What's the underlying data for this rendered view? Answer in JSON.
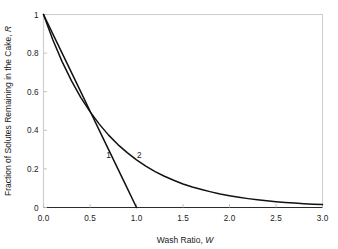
{
  "chart_data": {
    "type": "line",
    "title": "",
    "xlabel": "Wash Ratio, W",
    "xlabel_plain": "Wash Ratio, ",
    "xlabel_italic": "W",
    "ylabel": "Fraction of Solutes Remaining in the Cake, R",
    "ylabel_plain": "Fraction of Solutes Remaining in the Cake, ",
    "ylabel_italic": "R",
    "xlim": [
      0.0,
      3.0
    ],
    "ylim": [
      0.0,
      1.0
    ],
    "grid": false,
    "legend": "inline-curve-labels",
    "xticks": [
      0.0,
      0.5,
      1.0,
      1.5,
      2.0,
      2.5,
      3.0
    ],
    "xtick_labels": [
      "0.0",
      "0.5",
      "1.0",
      "1.5",
      "2.0",
      "2.5",
      "3.0"
    ],
    "yticks": [
      0.0,
      0.2,
      0.4,
      0.6,
      0.8,
      1.0
    ],
    "ytick_labels": [
      "0",
      "0.2",
      "0.4",
      "0.6",
      "0.8",
      "1"
    ],
    "series": [
      {
        "name": "1",
        "label": "1",
        "description": "plug-flow displacement, straight line",
        "label_x": 0.7,
        "label_y": 0.255,
        "color": "#111111",
        "x": [
          0.0,
          0.1,
          0.2,
          0.3,
          0.4,
          0.5,
          0.6,
          0.7,
          0.8,
          0.9,
          1.0
        ],
        "values": [
          1.0,
          0.9,
          0.8,
          0.7,
          0.6,
          0.5,
          0.4,
          0.3,
          0.2,
          0.1,
          0.0
        ]
      },
      {
        "name": "2",
        "label": "2",
        "description": "perfect-mixing exponential decay R = exp(-1.4 W)",
        "label_x": 1.03,
        "label_y": 0.255,
        "color": "#111111",
        "x": [
          0.0,
          0.1,
          0.2,
          0.3,
          0.4,
          0.5,
          0.6,
          0.7,
          0.8,
          0.9,
          1.0,
          1.1,
          1.2,
          1.3,
          1.4,
          1.5,
          1.6,
          1.7,
          1.8,
          1.9,
          2.0,
          2.1,
          2.2,
          2.3,
          2.4,
          2.5,
          2.6,
          2.7,
          2.8,
          2.9,
          3.0
        ],
        "values": [
          1.0,
          0.869,
          0.756,
          0.657,
          0.571,
          0.497,
          0.432,
          0.375,
          0.326,
          0.284,
          0.247,
          0.214,
          0.186,
          0.162,
          0.141,
          0.122,
          0.106,
          0.093,
          0.081,
          0.07,
          0.061,
          0.053,
          0.046,
          0.04,
          0.035,
          0.03,
          0.026,
          0.023,
          0.02,
          0.017,
          0.015
        ]
      }
    ],
    "colors": {
      "curve": "#111111",
      "axis": "#2b2b2b",
      "frame": "#cfcfcf",
      "tick": "#bdbdbd",
      "text": "#1a1a1a",
      "background": "#ffffff"
    }
  }
}
